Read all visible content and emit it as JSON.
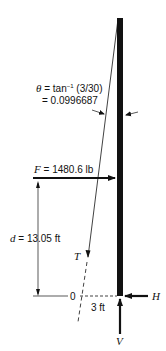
{
  "diagram": {
    "theta_label_symbol": "θ",
    "theta_label_expr": " = tan",
    "theta_label_sup": "−1",
    "theta_label_arg": " (3/30)",
    "theta_value": "= 0.0996687",
    "force_symbol": "F",
    "force_value": " = 1480.6 lb",
    "distance_symbol": "d",
    "distance_value": " = 13.05 ft",
    "tension_symbol": "T",
    "origin_label": "0",
    "offset_label": "3 ft",
    "horizontal_reaction": "H",
    "vertical_reaction": "V",
    "colors": {
      "ink": "#111111",
      "background": "#ffffff"
    }
  }
}
